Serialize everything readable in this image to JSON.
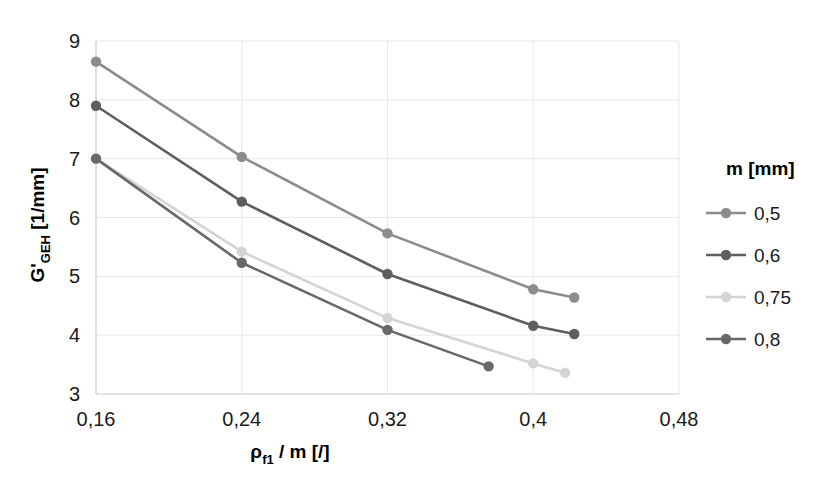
{
  "chart_data": {
    "type": "line",
    "title": "",
    "xlabel": "ρ_f1 / m [/]",
    "xlabel_main": "ρ",
    "xlabel_sub": "f1",
    "xlabel_rest": " / m [/]",
    "ylabel": "G'_GEH [1/mm]",
    "ylabel_main": "G'",
    "ylabel_sub": "GEH",
    "ylabel_rest": " [1/mm]",
    "xlim": [
      0.16,
      0.48
    ],
    "ylim": [
      3,
      9
    ],
    "xticks": [
      0.16,
      0.24,
      0.32,
      0.4,
      0.48
    ],
    "xtick_labels": [
      "0,16",
      "0,24",
      "0,32",
      "0,4",
      "0,48"
    ],
    "yticks": [
      3,
      4,
      5,
      6,
      7,
      8,
      9
    ],
    "ytick_labels": [
      "3",
      "4",
      "5",
      "6",
      "7",
      "8",
      "9"
    ],
    "grid": true,
    "legend_position": "right",
    "legend_title": "m [mm]",
    "series": [
      {
        "name": "0,5",
        "color": "#8c8c8c",
        "x": [
          0.16,
          0.24,
          0.32,
          0.4,
          0.4225
        ],
        "values": [
          8.65,
          7.03,
          5.73,
          4.78,
          4.64
        ]
      },
      {
        "name": "0,6",
        "color": "#5e5e5e",
        "x": [
          0.16,
          0.24,
          0.32,
          0.4,
          0.4225
        ],
        "values": [
          7.9,
          6.27,
          5.04,
          4.16,
          4.02
        ]
      },
      {
        "name": "0,75",
        "color": "#d4d4d4",
        "x": [
          0.16,
          0.24,
          0.32,
          0.4,
          0.4175
        ],
        "values": [
          7.0,
          5.42,
          4.29,
          3.52,
          3.36
        ]
      },
      {
        "name": "0,8",
        "color": "#686868",
        "x": [
          0.16,
          0.24,
          0.32,
          0.3755
        ],
        "values": [
          7.0,
          5.23,
          4.09,
          3.47
        ]
      }
    ]
  },
  "axes": {
    "grid_color": "#e8e8e8",
    "axis_color": "#c9c9c9",
    "background": "#ffffff"
  }
}
